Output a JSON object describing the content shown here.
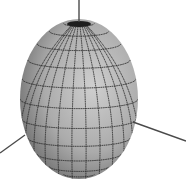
{
  "figure": {
    "colors": {
      "background": "#ffffff",
      "surface_light": "#c8c8c8",
      "surface_mid": "#a8a8a8",
      "surface_dark": "#3a3a3a",
      "grid_line": "#2a2a2a",
      "axis": "#4a4a4a"
    },
    "ellipsoid": {
      "cx": 79,
      "cy": 99,
      "rx": 59,
      "ry": 80
    },
    "grid": {
      "meridians": 14,
      "parallels": 12
    },
    "axes": [
      {
        "name": "z-axis",
        "x1": 79,
        "y1": 0,
        "x2": 79,
        "y2": 22
      },
      {
        "name": "x-axis",
        "x1": 133,
        "y1": 122,
        "x2": 186,
        "y2": 141
      },
      {
        "name": "y-axis",
        "x1": 0,
        "y1": 153,
        "x2": 25,
        "y2": 135
      }
    ]
  }
}
